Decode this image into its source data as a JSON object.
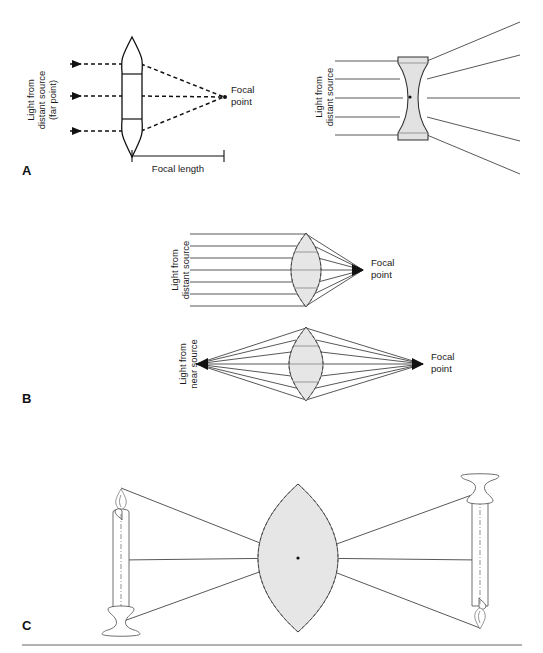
{
  "figure": {
    "background_color": "#ffffff",
    "width": 543,
    "height": 653
  },
  "panels": [
    {
      "letter": "A",
      "name": "panel-a",
      "diagrams": [
        {
          "name": "convex-lens-distant-source",
          "lens_type": "biconvex",
          "source_label": "Light from\ndistant source\n(far point)",
          "source_label_lines": [
            "Light from",
            "distant source",
            "(far point)"
          ],
          "focus_label": "Focal\npoint",
          "focus_label_lines": [
            "Focal",
            "point"
          ],
          "scale_label": "Focal length",
          "ray_count": 3,
          "ray_style": "dashed-with-arrowheads",
          "rays_converge": true
        },
        {
          "name": "concave-lens-distant-source",
          "lens_type": "biconcave",
          "source_label": "Light from\ndistant source",
          "source_label_lines": [
            "Light from",
            "distant source"
          ],
          "ray_count": 5,
          "ray_style": "solid",
          "rays_converge": false
        }
      ]
    },
    {
      "letter": "B",
      "name": "panel-b",
      "diagrams": [
        {
          "name": "accommodation-distant-source",
          "lens_type": "biconvex-flattened",
          "source_label": "Light from\ndistant source",
          "source_label_lines": [
            "Light from",
            "distant source"
          ],
          "focus_label": "Focal\npoint",
          "focus_label_lines": [
            "Focal",
            "point"
          ],
          "ray_count": 7,
          "ray_style": "solid",
          "rays_converge": true
        },
        {
          "name": "accommodation-near-source",
          "lens_type": "biconvex-rounded",
          "source_label": "Light from\nnear source",
          "source_label_lines": [
            "Light from",
            "near source"
          ],
          "focus_label": "Focal\npoint",
          "focus_label_lines": [
            "Focal",
            "point"
          ],
          "ray_count": 7,
          "ray_style": "solid",
          "rays_converge": true
        }
      ]
    },
    {
      "letter": "C",
      "name": "panel-c",
      "diagrams": [
        {
          "name": "image-inversion-by-lens",
          "lens_type": "biconvex-large",
          "object": "upright candle on candlestick",
          "image": "inverted candle on candlestick",
          "ray_count": 3,
          "ray_style": "solid",
          "rays_converge": true
        }
      ]
    }
  ],
  "labels": {
    "panel_a_letter": "A",
    "panel_b_letter": "B",
    "panel_c_letter": "C",
    "a_left_source_l1": "Light from",
    "a_left_source_l2": "distant source",
    "a_left_source_l3": "(far point)",
    "a_focal_point_l1": "Focal",
    "a_focal_point_l2": "point",
    "a_focal_length": "Focal length",
    "a_right_source_l1": "Light from",
    "a_right_source_l2": "distant source",
    "b_top_source_l1": "Light from",
    "b_top_source_l2": "distant source",
    "b_top_focal_l1": "Focal",
    "b_top_focal_l2": "point",
    "b_bottom_source_l1": "Light from",
    "b_bottom_source_l2": "near source",
    "b_bottom_focal_l1": "Focal",
    "b_bottom_focal_l2": "point"
  },
  "colors": {
    "ink": "#111111",
    "ray_solid": "#3a3a3a",
    "lens_fill": "#e2e2e2",
    "lens_stroke": "#333333",
    "outline": "#555555",
    "background": "#ffffff"
  }
}
